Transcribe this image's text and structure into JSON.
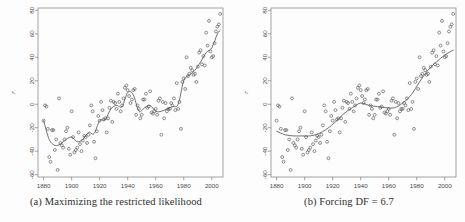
{
  "figure": {
    "title": "",
    "background_color": "#fdfdfd",
    "panels": [
      {
        "id": "a",
        "caption": "(a) Maximizing the restricted likelihood"
      },
      {
        "id": "b",
        "caption": "(b) Forcing DF = 6.7"
      }
    ]
  },
  "colors": {
    "point_stroke": "#555555",
    "line_stroke": "#4c4c4c",
    "axis": "#7c7c7c",
    "text": "#3a3a3a"
  },
  "chart_data": [
    {
      "type": "scatter",
      "panel": "a",
      "title": "(a) Maximizing the restricted likelihood",
      "xlabel": "",
      "ylabel": "r",
      "xlim": [
        1876,
        2008
      ],
      "ylim": [
        -62,
        82
      ],
      "xticks": [
        1880,
        1900,
        1920,
        1940,
        1960,
        1980,
        2000
      ],
      "yticks": [
        -60,
        -40,
        -20,
        0,
        20,
        40,
        60,
        80
      ],
      "grid": false,
      "legend": "none",
      "marker": "open-circle",
      "x": [
        1880,
        1881,
        1882,
        1883,
        1884,
        1885,
        1886,
        1887,
        1888,
        1889,
        1890,
        1891,
        1892,
        1893,
        1894,
        1895,
        1896,
        1897,
        1898,
        1899,
        1900,
        1901,
        1902,
        1903,
        1904,
        1905,
        1906,
        1907,
        1908,
        1909,
        1910,
        1911,
        1912,
        1913,
        1914,
        1915,
        1916,
        1917,
        1918,
        1919,
        1920,
        1921,
        1922,
        1923,
        1924,
        1925,
        1926,
        1927,
        1928,
        1929,
        1930,
        1931,
        1932,
        1933,
        1934,
        1935,
        1936,
        1937,
        1938,
        1939,
        1940,
        1941,
        1942,
        1943,
        1944,
        1945,
        1946,
        1947,
        1948,
        1949,
        1950,
        1951,
        1952,
        1953,
        1954,
        1955,
        1956,
        1957,
        1958,
        1959,
        1960,
        1961,
        1962,
        1963,
        1964,
        1965,
        1966,
        1967,
        1968,
        1969,
        1970,
        1971,
        1972,
        1973,
        1974,
        1975,
        1976,
        1977,
        1978,
        1979,
        1980,
        1981,
        1982,
        1983,
        1984,
        1985,
        1986,
        1987,
        1988,
        1989,
        1990,
        1991,
        1992,
        1993,
        1994,
        1995,
        1996,
        1997,
        1998,
        1999,
        2000,
        2001,
        2002,
        2003,
        2004,
        2005,
        2006
      ],
      "y": [
        -14,
        -1,
        -2,
        -21,
        -45,
        -49,
        -22,
        -22,
        -39,
        -30,
        -56,
        5,
        -33,
        -35,
        -37,
        -30,
        -23,
        -20,
        -38,
        -43,
        -6,
        -28,
        -41,
        -39,
        -37,
        -24,
        -34,
        -40,
        -31,
        -27,
        -28,
        -33,
        -26,
        -18,
        -1,
        -6,
        -32,
        -46,
        -23,
        -10,
        -14,
        2,
        -5,
        -13,
        -12,
        -24,
        -12,
        -3,
        3,
        -15,
        2,
        1,
        -4,
        9,
        2,
        -6,
        -1,
        5,
        14,
        16,
        12,
        7,
        1,
        4,
        12,
        13,
        -9,
        -1,
        -4,
        -12,
        -9,
        4,
        4,
        9,
        -3,
        -2,
        11,
        -7,
        -8,
        -6,
        -4,
        -9,
        3,
        5,
        -26,
        2,
        -12,
        1,
        -6,
        -4,
        -4,
        1,
        -1,
        5,
        -5,
        18,
        -4,
        2,
        -21,
        19,
        22,
        13,
        40,
        24,
        26,
        31,
        29,
        25,
        26,
        19,
        32,
        44,
        46,
        34,
        41,
        33,
        61,
        50,
        71,
        45,
        40,
        41,
        52,
        62,
        66,
        68,
        77
      ],
      "fit_curve_note": "wiggly smoothing spline, REML-selected DF (high flexibility)",
      "fit_x": [
        1880,
        1884,
        1888,
        1892,
        1896,
        1900,
        1904,
        1908,
        1912,
        1916,
        1920,
        1924,
        1928,
        1932,
        1936,
        1940,
        1944,
        1948,
        1952,
        1956,
        1960,
        1964,
        1968,
        1972,
        1976,
        1980,
        1984,
        1988,
        1992,
        1996,
        2000,
        2004,
        2006
      ],
      "fit_y": [
        -14,
        -30,
        -35,
        -34,
        -30,
        -28,
        -32,
        -30,
        -24,
        -25,
        -14,
        -13,
        -4,
        -1,
        -2,
        10,
        8,
        -6,
        -3,
        -1,
        -6,
        -6,
        -4,
        -2,
        0,
        20,
        25,
        29,
        36,
        44,
        48,
        60,
        63
      ]
    },
    {
      "type": "scatter",
      "panel": "b",
      "title": "(b) Forcing DF = 6.7",
      "xlabel": "",
      "ylabel": "r",
      "xlim": [
        1876,
        2008
      ],
      "ylim": [
        -62,
        82
      ],
      "xticks": [
        1880,
        1900,
        1920,
        1940,
        1960,
        1980,
        2000
      ],
      "yticks": [
        -60,
        -40,
        -20,
        0,
        20,
        40,
        60,
        80
      ],
      "grid": false,
      "legend": "none",
      "marker": "open-circle",
      "x": [
        1880,
        1881,
        1882,
        1883,
        1884,
        1885,
        1886,
        1887,
        1888,
        1889,
        1890,
        1891,
        1892,
        1893,
        1894,
        1895,
        1896,
        1897,
        1898,
        1899,
        1900,
        1901,
        1902,
        1903,
        1904,
        1905,
        1906,
        1907,
        1908,
        1909,
        1910,
        1911,
        1912,
        1913,
        1914,
        1915,
        1916,
        1917,
        1918,
        1919,
        1920,
        1921,
        1922,
        1923,
        1924,
        1925,
        1926,
        1927,
        1928,
        1929,
        1930,
        1931,
        1932,
        1933,
        1934,
        1935,
        1936,
        1937,
        1938,
        1939,
        1940,
        1941,
        1942,
        1943,
        1944,
        1945,
        1946,
        1947,
        1948,
        1949,
        1950,
        1951,
        1952,
        1953,
        1954,
        1955,
        1956,
        1957,
        1958,
        1959,
        1960,
        1961,
        1962,
        1963,
        1964,
        1965,
        1966,
        1967,
        1968,
        1969,
        1970,
        1971,
        1972,
        1973,
        1974,
        1975,
        1976,
        1977,
        1978,
        1979,
        1980,
        1981,
        1982,
        1983,
        1984,
        1985,
        1986,
        1987,
        1988,
        1989,
        1990,
        1991,
        1992,
        1993,
        1994,
        1995,
        1996,
        1997,
        1998,
        1999,
        2000,
        2001,
        2002,
        2003,
        2004,
        2005,
        2006
      ],
      "y": [
        -14,
        -1,
        -2,
        -21,
        -45,
        -49,
        -22,
        -22,
        -39,
        -30,
        -56,
        5,
        -33,
        -35,
        -37,
        -30,
        -23,
        -20,
        -38,
        -43,
        -6,
        -28,
        -41,
        -39,
        -37,
        -24,
        -34,
        -40,
        -31,
        -27,
        -28,
        -33,
        -26,
        -18,
        -1,
        -6,
        -32,
        -46,
        -23,
        -10,
        -14,
        2,
        -5,
        -13,
        -12,
        -24,
        -12,
        -3,
        3,
        -15,
        2,
        1,
        -4,
        9,
        2,
        -6,
        -1,
        5,
        14,
        16,
        12,
        7,
        1,
        4,
        12,
        13,
        -9,
        -1,
        -4,
        -12,
        -9,
        4,
        4,
        9,
        -3,
        -2,
        11,
        -7,
        -8,
        -6,
        -4,
        -9,
        3,
        5,
        -26,
        2,
        -12,
        1,
        -6,
        -4,
        -4,
        1,
        -1,
        5,
        -5,
        18,
        -4,
        2,
        -21,
        19,
        22,
        13,
        40,
        24,
        26,
        31,
        29,
        25,
        26,
        19,
        32,
        44,
        46,
        34,
        41,
        33,
        61,
        50,
        71,
        45,
        40,
        41,
        52,
        62,
        66,
        68,
        77
      ],
      "fit_curve_note": "smooth spline constrained to 6.7 degrees of freedom",
      "fit_x": [
        1880,
        1886,
        1892,
        1898,
        1904,
        1910,
        1916,
        1922,
        1928,
        1934,
        1940,
        1946,
        1952,
        1958,
        1964,
        1970,
        1976,
        1982,
        1988,
        1994,
        2000,
        2006
      ],
      "fit_y": [
        -23,
        -26,
        -27,
        -27,
        -27,
        -25,
        -21,
        -15,
        -8,
        -3,
        1,
        -1,
        -2,
        -3,
        -3,
        1,
        8,
        19,
        29,
        36,
        42,
        46
      ]
    }
  ]
}
